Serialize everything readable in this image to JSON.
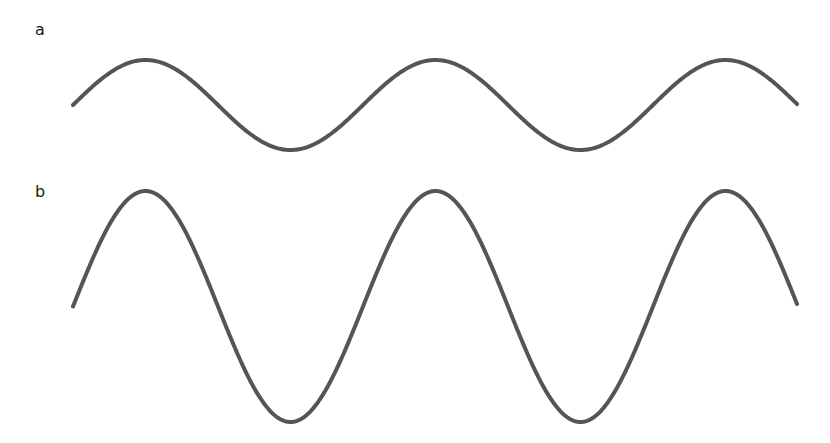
{
  "panels": [
    {
      "label": "a",
      "description": "low-amplitude sine wave"
    },
    {
      "label": "b",
      "description": "high-amplitude sine wave"
    }
  ],
  "waves": {
    "stroke_color": "#555555",
    "stroke_width": 4,
    "x_start": 73,
    "x_end": 797,
    "period_px": 290,
    "a": {
      "midline_y": 105,
      "amplitude_px": 45
    },
    "b": {
      "midline_y": 306.5,
      "amplitude_px": 115.5
    }
  }
}
